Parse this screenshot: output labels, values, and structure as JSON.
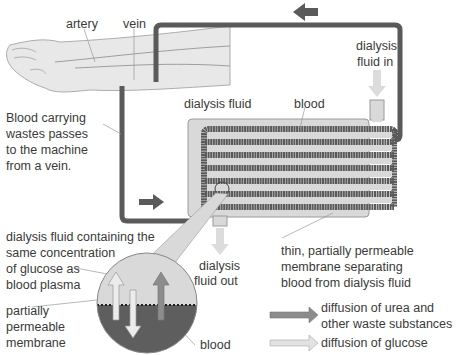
{
  "diagram": {
    "colors": {
      "tube": "#5a5a5a",
      "fluid": "#d9d9d9",
      "fluid_border": "#9a9a9a",
      "blood_region": "#5e5e5e",
      "arrow_dark": "#6b6b6b",
      "arrow_urea": "#8c8c8c",
      "arrow_glucose": "#e2e2e2",
      "arm": "#e8e8e8"
    },
    "labels": {
      "artery": "artery",
      "vein": "vein",
      "dialysis_fluid_in_1": "dialysis",
      "dialysis_fluid_in_2": "fluid in",
      "blood_carrying_1": "Blood carrying",
      "blood_carrying_2": "wastes passes",
      "blood_carrying_3": "to the machine",
      "blood_carrying_4": "from a vein.",
      "dialysis_fluid": "dialysis fluid",
      "blood": "blood",
      "containing_1": "dialysis fluid containing the",
      "containing_2": "same concentration",
      "containing_3": "of glucose as",
      "containing_4": "blood plasma",
      "fluid_out_1": "dialysis",
      "fluid_out_2": "fluid out",
      "thin_membrane_1": "thin, partially permeable",
      "thin_membrane_2": "membrane separating",
      "thin_membrane_3": "blood from dialysis fluid",
      "pp_membrane_1": "partially",
      "pp_membrane_2": "permeable",
      "pp_membrane_3": "membrane",
      "blood_inset": "blood"
    },
    "legend": [
      {
        "label_1": "diffusion of urea and",
        "label_2": "other waste substances",
        "color": "#8c8c8c"
      },
      {
        "label_1": "diffusion of glucose",
        "color": "#e2e2e2"
      }
    ],
    "flow_arrows": [
      "top-left",
      "bottom-right",
      "fluid-in-down",
      "fluid-out-down"
    ]
  }
}
